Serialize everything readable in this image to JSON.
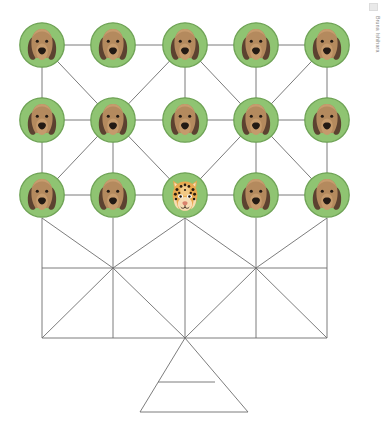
{
  "canvas": {
    "width": 384,
    "height": 424,
    "background": "#ffffff"
  },
  "credit": {
    "text": "Bruna Ishihara",
    "orientation": "vertical",
    "color": "#8a8a8a"
  },
  "palette": {
    "node_ring": "#7fb464",
    "node_fill": "#8fc472",
    "edge_color": "#7b7b7b",
    "lattice_color": "#6e6e6e",
    "dog_head": "#b48a5e",
    "dog_ear": "#5c4230",
    "dog_muzzle": "#c59a6c",
    "dog_nose": "#231a14",
    "dog_eye": "#231a14",
    "jaguar_base": "#e8a94f",
    "jaguar_spot": "#2b1d10",
    "jaguar_light": "#f6ddb4",
    "jaguar_nose": "#d9836d"
  },
  "graph": {
    "node_radius": 23,
    "columns_x": [
      42,
      113,
      185,
      256,
      327
    ],
    "rows_y": [
      45,
      120,
      195
    ],
    "nodes": [
      {
        "id": "n-0-0",
        "row": 0,
        "col": 0,
        "cx": 42,
        "cy": 45,
        "species": "dog",
        "label": "dog-node"
      },
      {
        "id": "n-0-1",
        "row": 0,
        "col": 1,
        "cx": 113,
        "cy": 45,
        "species": "dog",
        "label": "dog-node"
      },
      {
        "id": "n-0-2",
        "row": 0,
        "col": 2,
        "cx": 185,
        "cy": 45,
        "species": "dog",
        "label": "dog-node"
      },
      {
        "id": "n-0-3",
        "row": 0,
        "col": 3,
        "cx": 256,
        "cy": 45,
        "species": "dog",
        "label": "dog-node"
      },
      {
        "id": "n-0-4",
        "row": 0,
        "col": 4,
        "cx": 327,
        "cy": 45,
        "species": "dog",
        "label": "dog-node"
      },
      {
        "id": "n-1-0",
        "row": 1,
        "col": 0,
        "cx": 42,
        "cy": 120,
        "species": "dog",
        "label": "dog-node"
      },
      {
        "id": "n-1-1",
        "row": 1,
        "col": 1,
        "cx": 113,
        "cy": 120,
        "species": "dog",
        "label": "dog-node"
      },
      {
        "id": "n-1-2",
        "row": 1,
        "col": 2,
        "cx": 185,
        "cy": 120,
        "species": "dog",
        "label": "dog-node"
      },
      {
        "id": "n-1-3",
        "row": 1,
        "col": 3,
        "cx": 256,
        "cy": 120,
        "species": "dog",
        "label": "dog-node"
      },
      {
        "id": "n-1-4",
        "row": 1,
        "col": 4,
        "cx": 327,
        "cy": 120,
        "species": "dog",
        "label": "dog-node"
      },
      {
        "id": "n-2-0",
        "row": 2,
        "col": 0,
        "cx": 42,
        "cy": 195,
        "species": "dog",
        "label": "dog-node"
      },
      {
        "id": "n-2-1",
        "row": 2,
        "col": 1,
        "cx": 113,
        "cy": 195,
        "species": "dog",
        "label": "dog-node"
      },
      {
        "id": "n-2-2",
        "row": 2,
        "col": 2,
        "cx": 185,
        "cy": 195,
        "species": "jaguar",
        "label": "jaguar-node"
      },
      {
        "id": "n-2-3",
        "row": 2,
        "col": 3,
        "cx": 256,
        "cy": 195,
        "species": "dog",
        "label": "dog-node"
      },
      {
        "id": "n-2-4",
        "row": 2,
        "col": 4,
        "cx": 327,
        "cy": 195,
        "species": "dog",
        "label": "dog-node"
      }
    ],
    "edges": [
      {
        "x1": 42,
        "y1": 45,
        "x2": 113,
        "y2": 45
      },
      {
        "x1": 113,
        "y1": 45,
        "x2": 185,
        "y2": 45
      },
      {
        "x1": 185,
        "y1": 45,
        "x2": 256,
        "y2": 45
      },
      {
        "x1": 256,
        "y1": 45,
        "x2": 327,
        "y2": 45
      },
      {
        "x1": 42,
        "y1": 120,
        "x2": 113,
        "y2": 120
      },
      {
        "x1": 113,
        "y1": 120,
        "x2": 185,
        "y2": 120
      },
      {
        "x1": 185,
        "y1": 120,
        "x2": 256,
        "y2": 120
      },
      {
        "x1": 256,
        "y1": 120,
        "x2": 327,
        "y2": 120
      },
      {
        "x1": 42,
        "y1": 195,
        "x2": 113,
        "y2": 195
      },
      {
        "x1": 113,
        "y1": 195,
        "x2": 185,
        "y2": 195
      },
      {
        "x1": 185,
        "y1": 195,
        "x2": 256,
        "y2": 195
      },
      {
        "x1": 256,
        "y1": 195,
        "x2": 327,
        "y2": 195
      },
      {
        "x1": 42,
        "y1": 45,
        "x2": 42,
        "y2": 120
      },
      {
        "x1": 185,
        "y1": 45,
        "x2": 185,
        "y2": 120
      },
      {
        "x1": 256,
        "y1": 45,
        "x2": 256,
        "y2": 120
      },
      {
        "x1": 327,
        "y1": 45,
        "x2": 327,
        "y2": 120
      },
      {
        "x1": 42,
        "y1": 120,
        "x2": 42,
        "y2": 195
      },
      {
        "x1": 113,
        "y1": 120,
        "x2": 113,
        "y2": 195
      },
      {
        "x1": 256,
        "y1": 120,
        "x2": 256,
        "y2": 195
      },
      {
        "x1": 327,
        "y1": 120,
        "x2": 327,
        "y2": 195
      },
      {
        "x1": 42,
        "y1": 45,
        "x2": 113,
        "y2": 120
      },
      {
        "x1": 185,
        "y1": 45,
        "x2": 113,
        "y2": 120
      },
      {
        "x1": 185,
        "y1": 45,
        "x2": 256,
        "y2": 120
      },
      {
        "x1": 327,
        "y1": 45,
        "x2": 256,
        "y2": 120
      },
      {
        "x1": 113,
        "y1": 120,
        "x2": 42,
        "y2": 195
      },
      {
        "x1": 113,
        "y1": 120,
        "x2": 185,
        "y2": 195
      },
      {
        "x1": 256,
        "y1": 120,
        "x2": 185,
        "y2": 195
      },
      {
        "x1": 256,
        "y1": 120,
        "x2": 327,
        "y2": 195
      }
    ]
  },
  "lattice": {
    "stroke": "#6e6e6e",
    "stroke_width": 0.9,
    "frame": {
      "left": 42,
      "right": 327,
      "top": 218,
      "middle": 268,
      "bottom": 338
    },
    "verticals_x": [
      42,
      113,
      185,
      256,
      327
    ],
    "hub_left": {
      "x": 113,
      "y": 268
    },
    "hub_right": {
      "x": 256,
      "y": 268
    },
    "apex": {
      "x": 185,
      "y": 338
    },
    "segments": [
      {
        "x1": 42,
        "y1": 218,
        "x2": 42,
        "y2": 338
      },
      {
        "x1": 113,
        "y1": 218,
        "x2": 113,
        "y2": 338
      },
      {
        "x1": 185,
        "y1": 218,
        "x2": 185,
        "y2": 338
      },
      {
        "x1": 256,
        "y1": 218,
        "x2": 256,
        "y2": 338
      },
      {
        "x1": 327,
        "y1": 218,
        "x2": 327,
        "y2": 338
      },
      {
        "x1": 42,
        "y1": 268,
        "x2": 327,
        "y2": 268
      },
      {
        "x1": 42,
        "y1": 338,
        "x2": 327,
        "y2": 338
      },
      {
        "x1": 42,
        "y1": 218,
        "x2": 113,
        "y2": 268
      },
      {
        "x1": 185,
        "y1": 218,
        "x2": 113,
        "y2": 268
      },
      {
        "x1": 185,
        "y1": 218,
        "x2": 256,
        "y2": 268
      },
      {
        "x1": 327,
        "y1": 218,
        "x2": 256,
        "y2": 268
      },
      {
        "x1": 113,
        "y1": 268,
        "x2": 42,
        "y2": 338
      },
      {
        "x1": 113,
        "y1": 268,
        "x2": 185,
        "y2": 338
      },
      {
        "x1": 256,
        "y1": 268,
        "x2": 185,
        "y2": 338
      },
      {
        "x1": 256,
        "y1": 268,
        "x2": 327,
        "y2": 338
      },
      {
        "x1": 185,
        "y1": 338,
        "x2": 140,
        "y2": 412
      },
      {
        "x1": 185,
        "y1": 338,
        "x2": 248,
        "y2": 412
      },
      {
        "x1": 140,
        "y1": 412,
        "x2": 248,
        "y2": 412
      },
      {
        "x1": 158,
        "y1": 382,
        "x2": 215,
        "y2": 382
      }
    ]
  }
}
